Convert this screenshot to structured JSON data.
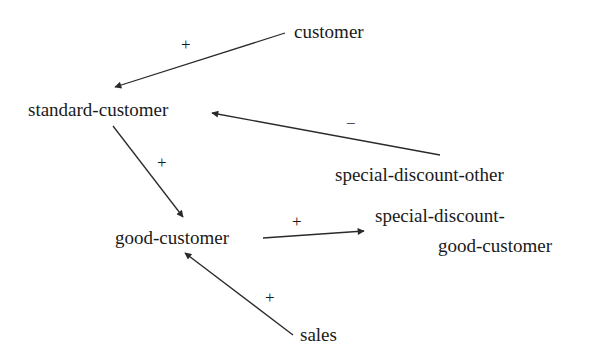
{
  "nodes": {
    "customer": "customer",
    "standard_customer": "standard-customer",
    "special_discount_other": "special-discount-other",
    "good_customer": "good-customer",
    "special_discount_good_customer_line1": "special-discount-",
    "special_discount_good_customer_line2": "good-customer",
    "sales": "sales"
  },
  "edges": [
    {
      "from": "customer",
      "to": "standard-customer",
      "sign": "+"
    },
    {
      "from": "special-discount-other",
      "to": "standard-customer",
      "sign": "−"
    },
    {
      "from": "standard-customer",
      "to": "good-customer",
      "sign": "+"
    },
    {
      "from": "good-customer",
      "to": "special-discount-good-customer",
      "sign": "+"
    },
    {
      "from": "sales",
      "to": "good-customer",
      "sign": "+"
    }
  ],
  "colors": {
    "line": "#2a2a2a",
    "text": "#1a1a1a",
    "background": "#ffffff"
  }
}
